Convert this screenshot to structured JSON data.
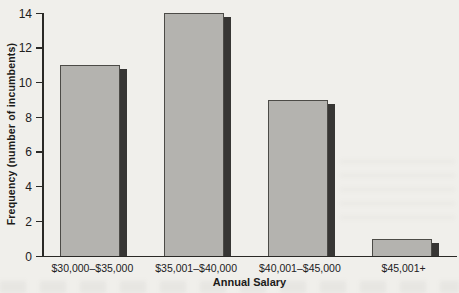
{
  "chart_data": {
    "type": "bar",
    "title": "",
    "categories": [
      "$30,000–$35,000",
      "$35,001–$40,000",
      "$40,001–$45,000",
      "$45,001+"
    ],
    "values": [
      11,
      14,
      9,
      1
    ],
    "xlabel": "Annual Salary",
    "ylabel": "Frequency (number of incumbents)",
    "ylim": [
      0,
      14
    ],
    "ytick_step": 2,
    "yticks": [
      0,
      2,
      4,
      6,
      8,
      10,
      12,
      14
    ],
    "grid": false,
    "legend": null,
    "colors": {
      "bar_fill": "#b4b3af",
      "bar_border": "#4c4b47",
      "bar_shadow": "#37познач3634",
      "axis": "#2a2926",
      "text": "#21201d",
      "background": "#f0efeb"
    }
  }
}
